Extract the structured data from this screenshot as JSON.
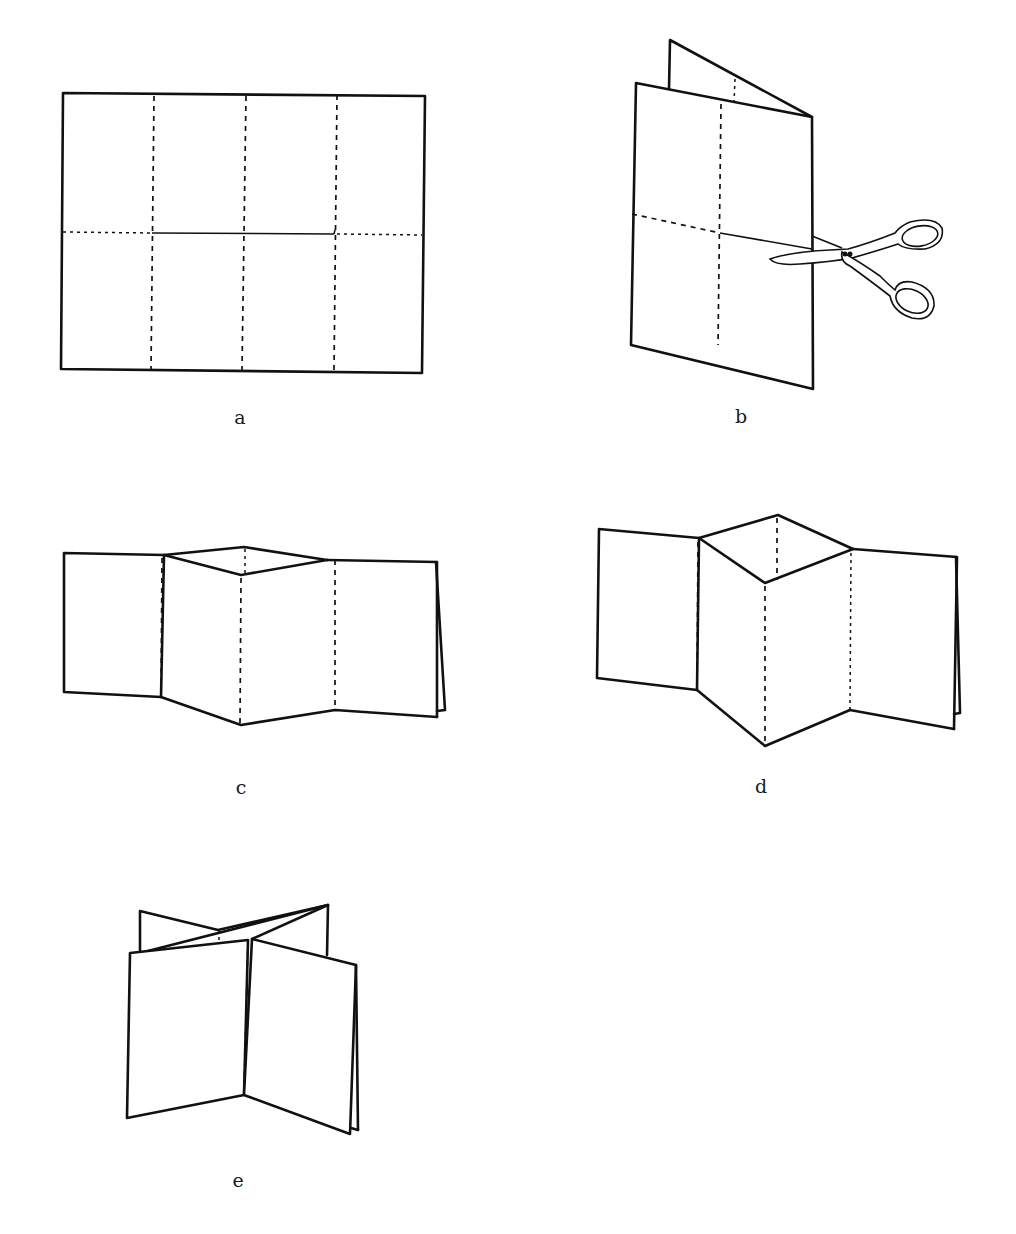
{
  "diagram": {
    "type": "paper-folding-instructions",
    "steps": [
      {
        "id": "a",
        "label": "a",
        "description": "Flat rectangular sheet with three vertical fold lines and horizontal center line; center section cut"
      },
      {
        "id": "b",
        "label": "b",
        "description": "Sheet folded in half vertically, scissors cutting along center line"
      },
      {
        "id": "c",
        "label": "c",
        "description": "Sheet opened into a zig-zag with a small diamond opening at top"
      },
      {
        "id": "d",
        "label": "d",
        "description": "Diamond opening widened further"
      },
      {
        "id": "e",
        "label": "e",
        "description": "Final X-shaped standing fold"
      }
    ]
  },
  "line_color": "#111111",
  "background": "#ffffff"
}
